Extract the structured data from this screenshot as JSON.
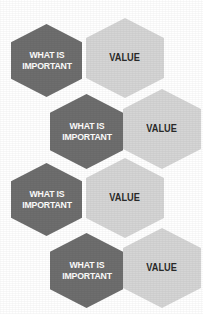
{
  "diagram": {
    "type": "hexagon-comparison-honeycomb",
    "title": "",
    "background_color": "#ffffff",
    "colors": {
      "dark_hex_fill": "#6e6e6e",
      "dark_hex_text": "#ffffff",
      "light_hex_fill": "#d5d5d5",
      "light_hex_text": "#2a2a2a"
    },
    "row_count": 4,
    "rows": [
      {
        "index": 1,
        "left": {
          "label": "WHAT IS\nIMPORTANT",
          "style": "dark"
        },
        "right": {
          "label": "VALUE",
          "style": "light"
        }
      },
      {
        "index": 2,
        "left": {
          "label": "WHAT IS\nIMPORTANT",
          "style": "dark"
        },
        "right": {
          "label": "VALUE",
          "style": "light"
        }
      },
      {
        "index": 3,
        "left": {
          "label": "WHAT IS\nIMPORTANT",
          "style": "dark"
        },
        "right": {
          "label": "VALUE",
          "style": "light"
        }
      },
      {
        "index": 4,
        "left": {
          "label": "WHAT IS\nIMPORTANT",
          "style": "dark"
        },
        "right": {
          "label": "VALUE",
          "style": "light"
        }
      }
    ]
  }
}
